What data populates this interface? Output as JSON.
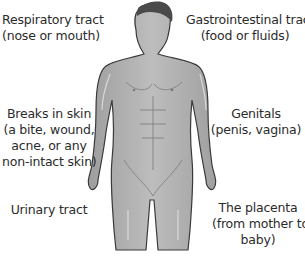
{
  "diagram": {
    "labels": [
      {
        "id": "respiratory",
        "line1": "Respiratory tract",
        "line2": "(nose or mouth)",
        "line3": ""
      },
      {
        "id": "gastrointestinal",
        "line1": "Gastrointestinal tract",
        "line2": "(food or fluids)",
        "line3": ""
      },
      {
        "id": "skin",
        "line1": "Breaks in skin",
        "line2": "(a bite, wound,",
        "line3": "acne, or any",
        "line4": "non-intact skin)"
      },
      {
        "id": "genitals",
        "line1": "Genitals",
        "line2": "(penis, vagina)",
        "line3": ""
      },
      {
        "id": "urinary",
        "line1": "Urinary tract",
        "line2": "",
        "line3": ""
      },
      {
        "id": "placenta",
        "line1": "The placenta",
        "line2": "(from mother to",
        "line3": "baby)"
      }
    ],
    "colors": {
      "skin_fill": "#b3b3b3",
      "skin_shadow": "#8c8c8c",
      "outline": "#3a3a3a",
      "hair": "#4a4a4a",
      "text": "#2b2b2b"
    }
  }
}
